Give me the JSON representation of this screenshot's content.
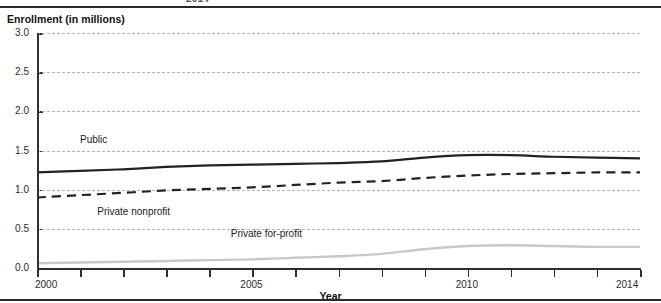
{
  "figure": {
    "top_clipped_caption": "2014",
    "y_axis_title": "Enrollment (in millions)",
    "x_axis_title": "Year"
  },
  "chart_data": {
    "type": "line",
    "title": "Enrollment (in millions)",
    "xlabel": "Year",
    "ylabel": "Enrollment (in millions)",
    "xlim": [
      2000,
      2014
    ],
    "ylim": [
      0.0,
      3.0
    ],
    "ytick_labels": [
      "0.0",
      "0.5",
      "1.0",
      "1.5",
      "2.0",
      "2.5",
      "3.0"
    ],
    "ytick_values": [
      0.0,
      0.5,
      1.0,
      1.5,
      2.0,
      2.5,
      3.0
    ],
    "xtick_labels": [
      "2000",
      "2005",
      "2010",
      "2014"
    ],
    "xtick_values": [
      2000,
      2005,
      2010,
      2014
    ],
    "x_minor_ticks": [
      2000,
      2001,
      2002,
      2003,
      2004,
      2005,
      2006,
      2007,
      2008,
      2009,
      2010,
      2011,
      2012,
      2013,
      2014
    ],
    "grid": "horizontal-dashed",
    "legend_position": "inline-labels",
    "x": [
      2000,
      2001,
      2002,
      2003,
      2004,
      2005,
      2006,
      2007,
      2008,
      2009,
      2010,
      2011,
      2012,
      2013,
      2014
    ],
    "series": [
      {
        "name": "Public",
        "style": "solid",
        "color": "#222222",
        "width": 2.2,
        "label_x": 2001.0,
        "label_y": 1.62,
        "values": [
          1.22,
          1.24,
          1.26,
          1.29,
          1.31,
          1.32,
          1.33,
          1.34,
          1.36,
          1.41,
          1.44,
          1.44,
          1.42,
          1.41,
          1.4
        ]
      },
      {
        "name": "Private nonprofit",
        "style": "dashed",
        "color": "#222222",
        "width": 2.2,
        "label_x": 2001.4,
        "label_y": 0.7,
        "values": [
          0.9,
          0.93,
          0.96,
          0.99,
          1.01,
          1.03,
          1.06,
          1.09,
          1.11,
          1.15,
          1.18,
          1.2,
          1.21,
          1.22,
          1.22
        ]
      },
      {
        "name": "Private for-profit",
        "style": "solid",
        "color": "#c8c8c8",
        "width": 2.4,
        "label_x": 2004.5,
        "label_y": 0.42,
        "values": [
          0.06,
          0.07,
          0.08,
          0.09,
          0.1,
          0.11,
          0.13,
          0.15,
          0.18,
          0.24,
          0.28,
          0.29,
          0.28,
          0.27,
          0.27
        ]
      }
    ]
  }
}
